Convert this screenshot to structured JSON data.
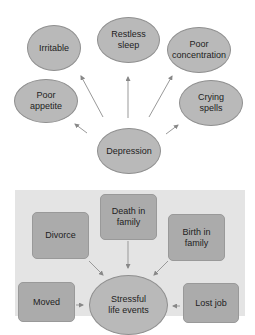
{
  "diagram_top": {
    "center": "Depression",
    "symptoms": [
      "Irritable",
      "Restless\nsleep",
      "Poor\nconcentration",
      "Poor\nappetite",
      "Crying\nspells"
    ]
  },
  "diagram_bottom": {
    "center": "Stressful\nlife events",
    "causes": [
      "Divorce",
      "Death in\nfamily",
      "Birth in\nfamily",
      "Moved",
      "Lost job"
    ]
  }
}
